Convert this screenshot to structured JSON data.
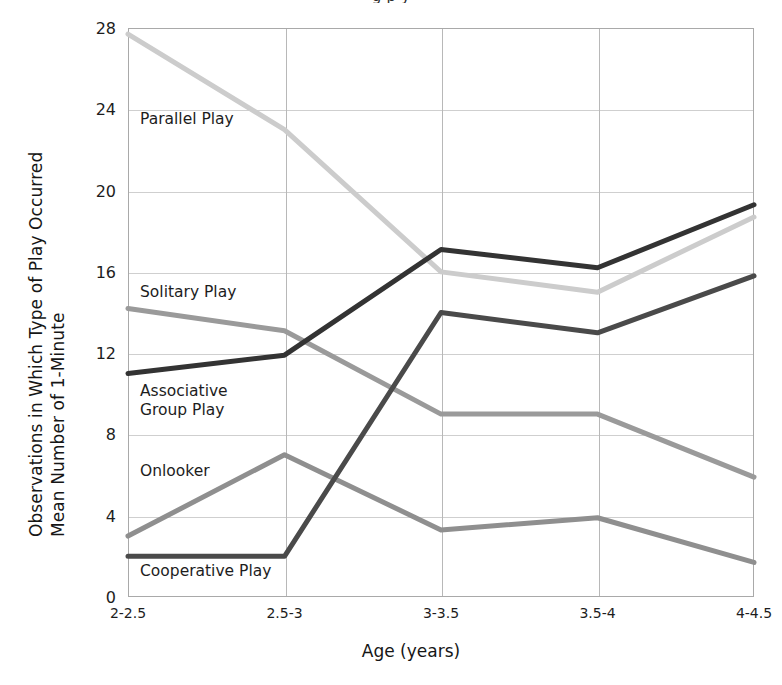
{
  "figure": {
    "top_cut_text": "g  p  y",
    "x_axis_title": "Age (years)",
    "y_axis_title_line1": "Mean Number of 1-Minute",
    "y_axis_title_line2": "Observations in Which  Type of Play Occurred"
  },
  "chart_data": {
    "type": "line",
    "title": "",
    "xlabel": "Age (years)",
    "ylabel": "Mean Number of 1-Minute Observations in Which Type of Play Occurred",
    "categories": [
      "2-2.5",
      "2.5-3",
      "3-3.5",
      "3.5-4",
      "4-4.5"
    ],
    "yticks": [
      0,
      4,
      8,
      12,
      16,
      20,
      24,
      28
    ],
    "ylim": [
      0,
      28
    ],
    "grid": "horizontal-and-vertical",
    "legend": "inline-labels",
    "series": [
      {
        "name": "Parallel Play",
        "color": "#cccccc",
        "values": [
          27.7,
          23.0,
          16.0,
          15.0,
          18.7
        ],
        "label_x": 140,
        "label_y": 110
      },
      {
        "name": "Solitary Play",
        "color": "#9a9a9a",
        "values": [
          14.2,
          13.1,
          9.0,
          9.0,
          5.9
        ],
        "label_x": 140,
        "label_y": 283
      },
      {
        "name": "Associative\nGroup Play",
        "color": "#333333",
        "values": [
          11.0,
          11.9,
          17.1,
          16.2,
          19.3
        ],
        "label_x": 140,
        "label_y": 382
      },
      {
        "name": "Onlooker",
        "color": "#8f8f8f",
        "values": [
          3.0,
          7.0,
          3.3,
          3.9,
          1.7
        ],
        "label_x": 140,
        "label_y": 462
      },
      {
        "name": "Cooperative Play",
        "color": "#4a4a4a",
        "values": [
          2.0,
          2.0,
          14.0,
          13.0,
          15.8
        ],
        "label_x": 140,
        "label_y": 562
      }
    ]
  }
}
